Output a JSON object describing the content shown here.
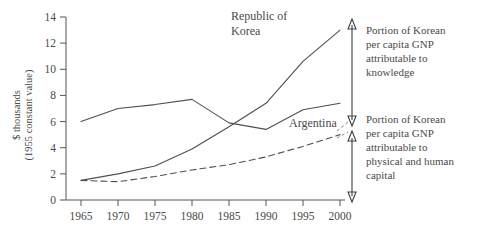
{
  "chart_data": {
    "type": "line",
    "title": "",
    "subtitle": "",
    "xlabel": "",
    "ylabel": "$ thousands\n(1955 constant value)",
    "ylabel_line1": "$ thousands",
    "ylabel_line2": "(1955 constant value)",
    "x": [
      1965,
      1970,
      1975,
      1980,
      1985,
      1990,
      1995,
      2000
    ],
    "xtick_labels": [
      "1965",
      "1970",
      "1975",
      "1980",
      "1985",
      "1990",
      "1995",
      "2000"
    ],
    "ytick_labels": [
      "0",
      "2",
      "4",
      "6",
      "8",
      "10",
      "12",
      "14"
    ],
    "ytick_values": [
      0,
      2,
      4,
      6,
      8,
      10,
      12,
      14
    ],
    "xlim": [
      1963,
      2001
    ],
    "ylim": [
      0,
      14
    ],
    "grid": false,
    "legend": "inline-labels",
    "series": [
      {
        "name": "Argentina",
        "style": "solid",
        "label": "Argentina",
        "values": [
          6.0,
          7.0,
          7.3,
          7.7,
          5.9,
          5.4,
          6.9,
          7.4
        ]
      },
      {
        "name": "Republic of Korea",
        "style": "solid",
        "label": "Republic of Korea",
        "label_line1": "Republic of",
        "label_line2": "Korea",
        "values": [
          1.5,
          2.0,
          2.6,
          3.9,
          5.6,
          7.4,
          10.6,
          13.0
        ]
      },
      {
        "name": "Korea physical and human capital",
        "style": "dashed",
        "label": "",
        "values": [
          1.5,
          1.4,
          1.8,
          2.3,
          2.7,
          3.3,
          4.1,
          5.0
        ]
      }
    ],
    "annotations": [
      {
        "id": "knowledge-bracket",
        "text": "Portion of Korean per capita GNP attributable to knowledge",
        "lines": [
          "Portion of Korean",
          "per capita GNP",
          "attributable to",
          "knowledge"
        ],
        "bracket_top_value": 13.0,
        "bracket_bottom_value": 5.0
      },
      {
        "id": "capital-bracket",
        "text": "Portion of Korean per capita GNP attributable to physical and human capital",
        "lines": [
          "Portion of Korean",
          "per capita GNP",
          "attributable to",
          "physical and human",
          "capital"
        ],
        "bracket_top_value": 5.0,
        "bracket_bottom_value": 0.0
      }
    ],
    "colors": {
      "line": "#4f4f4f",
      "axis": "#555555",
      "text": "#4a4a4a",
      "background": "#ffffff"
    }
  }
}
